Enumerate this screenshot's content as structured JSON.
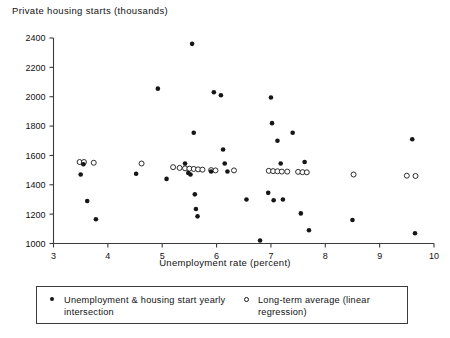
{
  "chart_data": {
    "type": "scatter",
    "title": "Private housing starts (thousands)",
    "subtitle": "",
    "xlabel": "Unemployment rate (percent)",
    "ylabel": "Private housing starts (thousands)",
    "xlim": [
      3,
      10
    ],
    "ylim": [
      1000,
      2400
    ],
    "xticks": [
      3,
      4,
      5,
      6,
      7,
      8,
      9,
      10
    ],
    "yticks": [
      1000,
      1200,
      1400,
      1600,
      1800,
      2000,
      2200,
      2400
    ],
    "xtick_labels": [
      "3",
      "4",
      "5",
      "6",
      "7",
      "8",
      "9",
      "10"
    ],
    "ytick_labels": [
      "1000",
      "1200",
      "1400",
      "1600",
      "1800",
      "2000",
      "2200",
      "2400"
    ],
    "grid": false,
    "legend_position": "below-outside",
    "marker_colors": {
      "filled": "#161616",
      "open_stroke": "#161616",
      "open_fill": "#ffffff"
    },
    "axis_color": "#3b3b3b",
    "background": "#ffffff",
    "series": [
      {
        "name": "Unemployment & housing start yearly intersection",
        "marker": "filled-circle",
        "points": [
          [
            3.5,
            1470
          ],
          [
            3.55,
            1540
          ],
          [
            3.62,
            1290
          ],
          [
            3.78,
            1165
          ],
          [
            4.52,
            1475
          ],
          [
            4.92,
            2055
          ],
          [
            5.08,
            1440
          ],
          [
            5.42,
            1545
          ],
          [
            5.48,
            1480
          ],
          [
            5.52,
            1470
          ],
          [
            5.55,
            2360
          ],
          [
            5.58,
            1755
          ],
          [
            5.6,
            1335
          ],
          [
            5.62,
            1235
          ],
          [
            5.65,
            1185
          ],
          [
            5.9,
            1490
          ],
          [
            5.95,
            2030
          ],
          [
            6.08,
            2010
          ],
          [
            6.12,
            1640
          ],
          [
            6.15,
            1545
          ],
          [
            6.2,
            1490
          ],
          [
            6.55,
            1300
          ],
          [
            6.8,
            1020
          ],
          [
            6.95,
            1345
          ],
          [
            7.0,
            1995
          ],
          [
            7.02,
            1820
          ],
          [
            7.05,
            1295
          ],
          [
            7.12,
            1700
          ],
          [
            7.18,
            1545
          ],
          [
            7.22,
            1300
          ],
          [
            7.4,
            1755
          ],
          [
            7.55,
            1205
          ],
          [
            7.62,
            1555
          ],
          [
            7.7,
            1090
          ],
          [
            8.5,
            1160
          ],
          [
            9.6,
            1710
          ],
          [
            9.65,
            1070
          ]
        ]
      },
      {
        "name": "Long-term average (linear regression)",
        "marker": "open-circle",
        "points": [
          [
            3.48,
            1555
          ],
          [
            3.56,
            1555
          ],
          [
            3.74,
            1550
          ],
          [
            4.62,
            1545
          ],
          [
            5.2,
            1520
          ],
          [
            5.32,
            1515
          ],
          [
            5.42,
            1512
          ],
          [
            5.5,
            1510
          ],
          [
            5.58,
            1508
          ],
          [
            5.66,
            1505
          ],
          [
            5.74,
            1503
          ],
          [
            5.9,
            1500
          ],
          [
            5.98,
            1498
          ],
          [
            6.32,
            1498
          ],
          [
            6.96,
            1495
          ],
          [
            7.04,
            1493
          ],
          [
            7.12,
            1492
          ],
          [
            7.2,
            1490
          ],
          [
            7.3,
            1490
          ],
          [
            7.5,
            1488
          ],
          [
            7.58,
            1486
          ],
          [
            7.66,
            1485
          ],
          [
            8.52,
            1470
          ],
          [
            9.5,
            1462
          ],
          [
            9.66,
            1460
          ]
        ]
      }
    ]
  },
  "legend": {
    "entries": [
      {
        "marker": "filled-circle",
        "label": "Unemployment & housing start yearly intersection"
      },
      {
        "marker": "open-circle",
        "label": "Long-term average (linear regression)"
      }
    ]
  }
}
